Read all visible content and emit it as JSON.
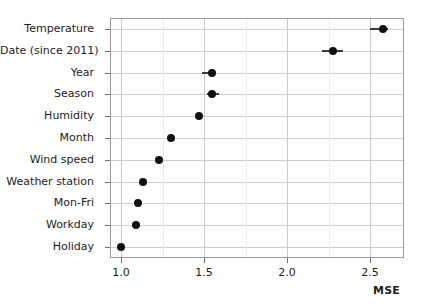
{
  "chart_data": {
    "type": "scatter",
    "orientation": "horizontal",
    "title": "",
    "subtitle": "",
    "xlabel": "MSE",
    "ylabel": "",
    "xlim": [
      0.9,
      2.67
    ],
    "ylim": [
      0,
      11
    ],
    "grid": true,
    "legend": null,
    "x_ticks": [
      "1.0",
      "1.5",
      "2.0",
      "2.5"
    ],
    "x_tick_values": [
      1.0,
      1.5,
      2.0,
      2.5
    ],
    "x_minor_tick_values": [
      1.25,
      1.75,
      2.25
    ],
    "categories": [
      "Temperature",
      "Date (since 2011)",
      "Year",
      "Season",
      "Humidity",
      "Month",
      "Wind speed",
      "Weather station",
      "Mon-Fri",
      "Workday",
      "Holiday"
    ],
    "values": [
      2.58,
      2.28,
      1.55,
      1.55,
      1.47,
      1.3,
      1.23,
      1.13,
      1.1,
      1.09,
      1.0
    ],
    "error_low": [
      2.5,
      2.21,
      1.49,
      1.52,
      1.45,
      1.3,
      1.23,
      1.13,
      1.1,
      1.09,
      1.0
    ],
    "error_high": [
      2.61,
      2.34,
      1.56,
      1.59,
      1.48,
      1.3,
      1.23,
      1.13,
      1.1,
      1.09,
      1.0
    ],
    "points": [
      {
        "label": "Temperature",
        "value": 2.58,
        "low": 2.5,
        "high": 2.61
      },
      {
        "label": "Date (since 2011)",
        "value": 2.28,
        "low": 2.21,
        "high": 2.34
      },
      {
        "label": "Year",
        "value": 1.55,
        "low": 1.49,
        "high": 1.56
      },
      {
        "label": "Season",
        "value": 1.55,
        "low": 1.52,
        "high": 1.59
      },
      {
        "label": "Humidity",
        "value": 1.47,
        "low": 1.45,
        "high": 1.48
      },
      {
        "label": "Month",
        "value": 1.3,
        "low": 1.3,
        "high": 1.3
      },
      {
        "label": "Wind speed",
        "value": 1.23,
        "low": 1.23,
        "high": 1.23
      },
      {
        "label": "Weather station",
        "value": 1.13,
        "low": 1.13,
        "high": 1.13
      },
      {
        "label": "Mon-Fri",
        "value": 1.1,
        "low": 1.1,
        "high": 1.1
      },
      {
        "label": "Workday",
        "value": 1.09,
        "low": 1.09,
        "high": 1.09
      },
      {
        "label": "Holiday",
        "value": 1.0,
        "low": 1.0,
        "high": 1.0
      }
    ],
    "colors": {
      "marker": "#111111",
      "error_bar": "#3c3c3c",
      "grid_major": "#c9c9c9",
      "grid_minor": "#ebebeb",
      "frame": "#9a9a9a",
      "text": "#1c1c1c",
      "background": "#ffffff"
    }
  }
}
